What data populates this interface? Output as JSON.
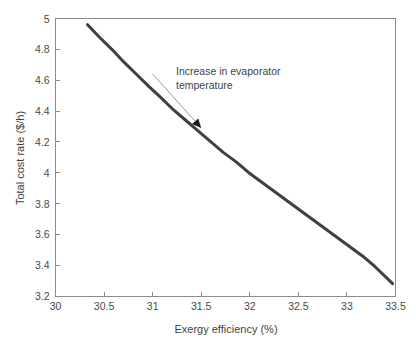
{
  "figure": {
    "background_color": "#ffffff",
    "axis_color": "#8c8c8c",
    "text_color": "#3f3f3f"
  },
  "chart_data": {
    "type": "line",
    "title": "",
    "xlabel": "Exergy efficiency (%)",
    "ylabel": "Total cost rate ($/h)",
    "xlim": [
      30,
      33.5
    ],
    "ylim": [
      3.2,
      5
    ],
    "grid": false,
    "legend": null,
    "series": [
      {
        "name": "Pareto front",
        "color": "#404040",
        "line_width": 3,
        "x": [
          30.33,
          30.45,
          30.58,
          30.7,
          30.83,
          30.96,
          31.08,
          31.21,
          31.34,
          31.47,
          31.6,
          31.73,
          31.86,
          31.99,
          32.12,
          32.25,
          32.38,
          32.51,
          32.64,
          32.77,
          32.9,
          33.03,
          33.16,
          33.29,
          33.47
        ],
        "y": [
          4.96,
          4.88,
          4.8,
          4.72,
          4.64,
          4.56,
          4.49,
          4.41,
          4.34,
          4.27,
          4.2,
          4.13,
          4.07,
          4.0,
          3.94,
          3.88,
          3.82,
          3.76,
          3.7,
          3.64,
          3.58,
          3.52,
          3.46,
          3.39,
          3.28
        ]
      }
    ],
    "xticks": [
      30,
      30.5,
      31,
      31.5,
      32,
      32.5,
      33,
      33.5
    ],
    "xticklabels": [
      "30",
      "30.5",
      "31",
      "31.5",
      "32",
      "32.5",
      "33",
      "33.5"
    ],
    "yticks": [
      3.2,
      3.4,
      3.6,
      3.8,
      4,
      4.2,
      4.4,
      4.6,
      4.8,
      5
    ],
    "yticklabels": [
      "3.2",
      "3.4",
      "3.6",
      "3.8",
      "4",
      "4.2",
      "4.4",
      "4.6",
      "4.8",
      "5"
    ],
    "annotations": [
      {
        "name": "increase-evaporator-temperature",
        "line1": "Increase in evaporator",
        "line2": "temperature",
        "arrow_from": [
          31.0,
          4.64
        ],
        "arrow_to": [
          31.5,
          4.29
        ],
        "arrow_color": "#9a9a9a",
        "head_color": "#1c1c1c"
      }
    ]
  }
}
